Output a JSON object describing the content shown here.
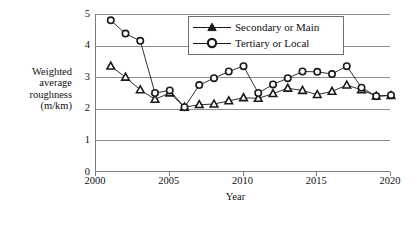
{
  "chart_data": {
    "type": "line",
    "title": "",
    "xlabel": "Year",
    "ylabel": "Weighted average roughness (m/km)",
    "ylabel_lines": [
      "Weighted",
      "average",
      "roughness",
      "(m/km)"
    ],
    "xlim": [
      2000,
      2020
    ],
    "ylim": [
      0,
      5
    ],
    "xticks": [
      2000,
      2005,
      2010,
      2015,
      2020
    ],
    "xtick_labels": [
      "2000",
      "2005",
      "2010",
      "2015",
      "2020"
    ],
    "yticks": [
      0,
      1,
      2,
      3,
      4,
      5
    ],
    "ytick_labels": [
      "0",
      "1",
      "2",
      "3",
      "4",
      "5"
    ],
    "grid": "horizontal",
    "legend_position": "top-center",
    "x": [
      2001,
      2002,
      2003,
      2004,
      2005,
      2006,
      2007,
      2008,
      2009,
      2010,
      2011,
      2012,
      2013,
      2014,
      2015,
      2016,
      2017,
      2018,
      2019,
      2020
    ],
    "series": [
      {
        "name": "Secondary or Main",
        "marker": "triangle",
        "color": "#1a1a1a",
        "values": [
          3.35,
          3.0,
          2.6,
          2.3,
          2.5,
          2.05,
          2.13,
          2.15,
          2.25,
          2.35,
          2.33,
          2.48,
          2.65,
          2.58,
          2.45,
          2.55,
          2.75,
          2.6,
          2.4,
          2.42
        ]
      },
      {
        "name": "Tertiary or Local",
        "marker": "circle",
        "color": "#1a1a1a",
        "values": [
          4.8,
          4.38,
          4.15,
          2.5,
          2.58,
          2.05,
          2.75,
          2.97,
          3.18,
          3.35,
          2.5,
          2.77,
          2.97,
          3.18,
          3.17,
          3.1,
          3.35,
          2.67,
          2.4,
          2.43
        ]
      }
    ]
  },
  "legend": {
    "items": [
      {
        "label": "Secondary or Main",
        "marker": "triangle"
      },
      {
        "label": "Tertiary or Local",
        "marker": "circle"
      }
    ]
  }
}
